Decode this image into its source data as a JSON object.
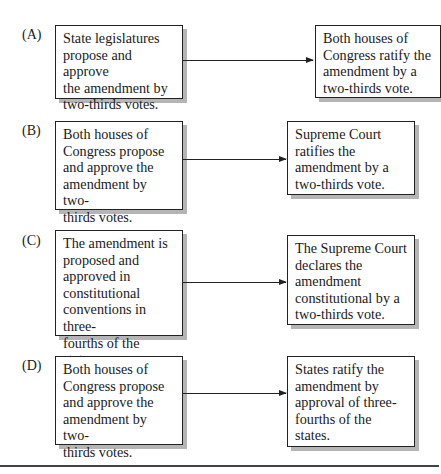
{
  "options": [
    {
      "label": "(A)",
      "proposal": "State legislatures\npropose and approve\nthe amendment by\ntwo-thirds votes.",
      "ratification": "Both houses of\nCongress ratify the\namendment by a\ntwo-thirds vote."
    },
    {
      "label": "(B)",
      "proposal": "Both houses of\nCongress propose\nand approve the\namendment by two-\nthirds votes.",
      "ratification": "Supreme Court\nratifies the\namendment by a\ntwo-thirds vote."
    },
    {
      "label": "(C)",
      "proposal": "The amendment is\nproposed and\napproved in\nconstitutional\nconventions in three-\nfourths of the states.",
      "ratification": "The Supreme Court\ndeclares the\namendment\nconstitutional by a\ntwo-thirds vote."
    },
    {
      "label": "(D)",
      "proposal": "Both houses of\nCongress propose\nand approve the\namendment by two-\nthirds votes.",
      "ratification": "States ratify the\namendment by\napproval of three-\nfourths of the\nstates."
    }
  ]
}
